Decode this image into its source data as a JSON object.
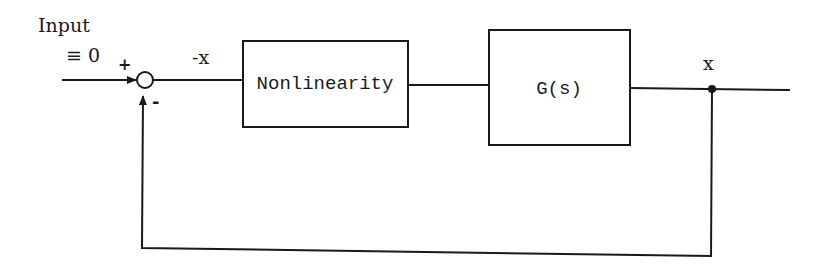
{
  "diagram": {
    "type": "block-diagram",
    "colors": {
      "ink": "#1a1a1a",
      "background": "#ffffff"
    },
    "input": {
      "label_line1": "Input",
      "label_line2": "≡ 0"
    },
    "summing_junction": {
      "plus_sign": "+",
      "minus_sign": "-"
    },
    "signals": {
      "error_label": "-x",
      "output_label": "x"
    },
    "blocks": [
      {
        "id": "nonlinearity",
        "label": "Nonlinearity"
      },
      {
        "id": "plant",
        "label": "G(s)"
      }
    ],
    "feedback": {
      "type": "unity",
      "sign": "negative"
    }
  }
}
